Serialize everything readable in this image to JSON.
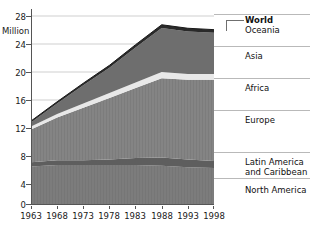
{
  "chart_data": {
    "type": "area",
    "title": "",
    "subtitle": "",
    "xlabel": "",
    "ylabel": "Million",
    "unit_label": "Million",
    "stacked": true,
    "grid": true,
    "grid_axis": "y",
    "legend_position": "right",
    "x": [
      1963,
      1968,
      1973,
      1978,
      1983,
      1988,
      1993,
      1998
    ],
    "xlim": [
      1963,
      1998
    ],
    "xticklabels": [
      "1963",
      "1968",
      "1973",
      "1978",
      "1983",
      "1988",
      "1993",
      "1998"
    ],
    "ylim": [
      0,
      28
    ],
    "yticks": [
      0,
      4,
      8,
      12,
      16,
      20,
      24,
      28
    ],
    "yticklabels": [
      "0",
      "4",
      "8",
      "12",
      "16",
      "20",
      "24",
      "28"
    ],
    "series": [
      {
        "name": "North America",
        "color": "#7c7c7c",
        "values": [
          5.5,
          5.7,
          5.7,
          5.7,
          5.7,
          5.6,
          5.4,
          5.3
        ]
      },
      {
        "name": "Latin America and Caribbean",
        "color": "#5e5e5e",
        "values": [
          0.6,
          0.7,
          0.7,
          0.8,
          1.0,
          1.2,
          1.1,
          1.0
        ]
      },
      {
        "name": "Europe",
        "color": "#848484",
        "values": [
          4.7,
          6.1,
          7.5,
          8.8,
          10.0,
          11.3,
          11.4,
          11.6
        ]
      },
      {
        "name": "Africa",
        "color": "#e8e8e8",
        "values": [
          0.4,
          0.5,
          0.6,
          0.7,
          0.8,
          0.9,
          0.8,
          0.8
        ]
      },
      {
        "name": "Asia",
        "color": "#6e6e6e",
        "values": [
          0.6,
          1.5,
          2.6,
          3.6,
          5.0,
          6.3,
          6.1,
          5.9
        ]
      },
      {
        "name": "Oceania",
        "color": "#2a2a2a",
        "values": [
          0.2,
          0.25,
          0.3,
          0.35,
          0.4,
          0.45,
          0.45,
          0.45
        ]
      }
    ],
    "total_name": "World",
    "totals": [
      12.0,
      14.75,
      17.4,
      19.95,
      22.9,
      25.75,
      25.25,
      25.05
    ],
    "legend_entries": [
      {
        "label": "World",
        "bold": true
      },
      {
        "label": "Oceania",
        "bold": false
      },
      {
        "label": "Asia",
        "bold": false
      },
      {
        "label": "Africa",
        "bold": false
      },
      {
        "label": "Europe",
        "bold": false
      },
      {
        "label": "Latin America\nand Caribbean",
        "bold": false
      },
      {
        "label": "North America",
        "bold": false
      }
    ]
  },
  "colors": {
    "background": "#ffffff",
    "gridline": "#cfcfcf",
    "axis": "#555555",
    "text": "#111111",
    "legend_rule": "#b9b9b9",
    "leader": "#6f6f6f"
  }
}
